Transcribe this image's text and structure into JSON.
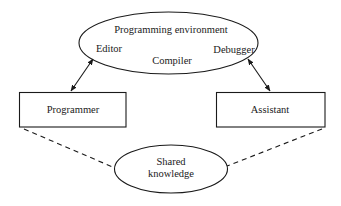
{
  "diagram": {
    "programming_environment": {
      "title": "Programming environment",
      "components": {
        "editor": "Editor",
        "compiler": "Compiler",
        "debugger": "Debugger"
      }
    },
    "programmer": {
      "label": "Programmer"
    },
    "assistant": {
      "label": "Assistant"
    },
    "shared_knowledge": {
      "line1": "Shared",
      "line2": "knowledge"
    },
    "edges": [
      {
        "from": "Programmer",
        "to": "Programming environment",
        "style": "solid",
        "arrows": "both"
      },
      {
        "from": "Assistant",
        "to": "Programming environment",
        "style": "solid",
        "arrows": "both"
      },
      {
        "from": "Programmer",
        "to": "Shared knowledge",
        "style": "dashed",
        "arrows": "none"
      },
      {
        "from": "Assistant",
        "to": "Shared knowledge",
        "style": "dashed",
        "arrows": "none"
      }
    ],
    "colors": {
      "stroke": "#1a1a1a",
      "background": "#ffffff"
    }
  }
}
